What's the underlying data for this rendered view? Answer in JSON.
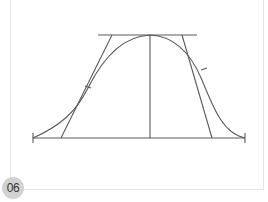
{
  "figure": {
    "number": "06",
    "caption": "",
    "stroke_color": "#5a5a5a",
    "geometry": {
      "baseline": {
        "y": 138,
        "x1": 33,
        "x2": 245
      },
      "top_line": {
        "y": 35,
        "x1": 98,
        "x2": 197
      },
      "center_vertical": {
        "x": 150,
        "y1": 35,
        "y2": 138
      },
      "left_tangent": {
        "x1": 112,
        "y1": 35,
        "x2": 61,
        "y2": 138
      },
      "right_tangent": {
        "x1": 182,
        "y1": 35,
        "x2": 212,
        "y2": 138
      }
    }
  }
}
